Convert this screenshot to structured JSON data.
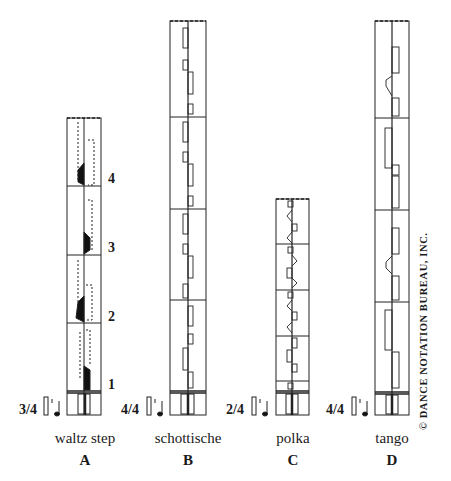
{
  "figure": {
    "copyright": "© DANCE NOTATION BUREAU, INC.",
    "panels": [
      {
        "id": "A",
        "name": "waltz step",
        "letter": "A",
        "meter": "3/4",
        "measures": [
          "1",
          "2",
          "3",
          "4"
        ]
      },
      {
        "id": "B",
        "name": "schottische",
        "letter": "B",
        "meter": "4/4",
        "measures": []
      },
      {
        "id": "C",
        "name": "polka",
        "letter": "C",
        "meter": "2/4",
        "measures": []
      },
      {
        "id": "D",
        "name": "tango",
        "letter": "D",
        "meter": "4/4",
        "measures": []
      }
    ]
  },
  "colors": {
    "ink": "#1a1a1a",
    "paper": "#ffffff"
  }
}
